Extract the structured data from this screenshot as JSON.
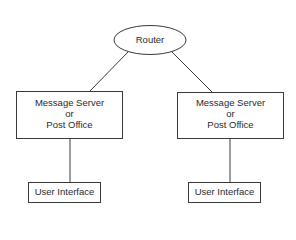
{
  "diagram": {
    "router": {
      "label": "Router"
    },
    "left_server": {
      "lines": [
        "Message Server",
        "or",
        "Post Office"
      ]
    },
    "right_server": {
      "lines": [
        "Message Server",
        "or",
        "Post Office"
      ]
    },
    "left_ui": {
      "label": "User Interface"
    },
    "right_ui": {
      "label": "User Interface"
    },
    "colors": {
      "stroke": "#3a3a3a",
      "background": "#ffffff",
      "text": "#2a2a2a"
    }
  }
}
